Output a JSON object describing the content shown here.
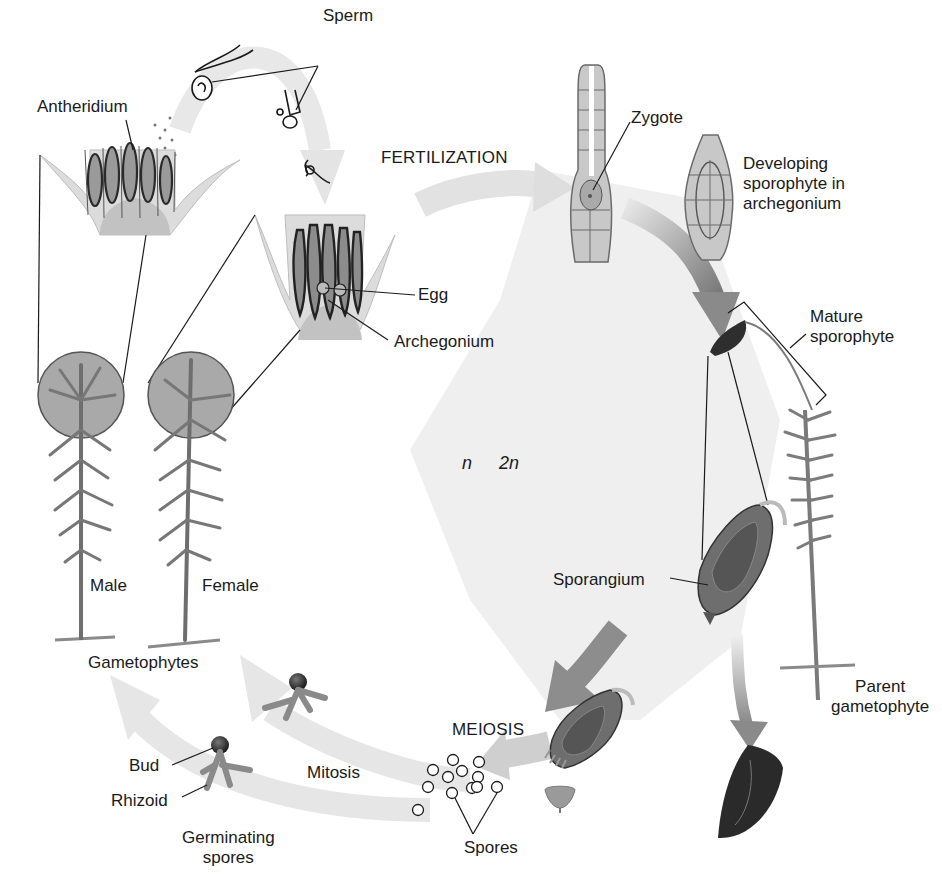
{
  "diagram": {
    "phases": {
      "haploid": "n",
      "diploid": "2n"
    },
    "processes": {
      "fertilization": "FERTILIZATION",
      "meiosis": "MEIOSIS",
      "mitosis": "Mitosis"
    },
    "labels": {
      "sperm": "Sperm",
      "antheridium": "Antheridium",
      "egg": "Egg",
      "archegonium": "Archegonium",
      "zygote": "Zygote",
      "developing_sporophyte": "Developing\nsporophyte in\narchegonium",
      "mature_sporophyte": "Mature\nsporophyte",
      "sporangium": "Sporangium",
      "parent_gametophyte": "Parent\ngametophyte",
      "male": "Male",
      "female": "Female",
      "gametophytes": "Gametophytes",
      "bud": "Bud",
      "rhizoid": "Rhizoid",
      "germinating_spores": "Germinating\nspores",
      "spores": "Spores"
    },
    "colors": {
      "arrow_light": "#e3e3e3",
      "arrow_dark": "#8a8a8a",
      "diploid_bg": "#ececec",
      "plant_fill": "#8c8c8c",
      "plant_dark": "#3a3a3a",
      "tissue_fill": "#c8c8c8",
      "circle_fill": "#a9a9a9",
      "line": "#1a1a1a"
    }
  }
}
